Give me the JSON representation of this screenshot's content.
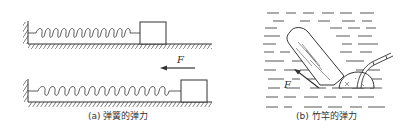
{
  "figure": {
    "panel_a": {
      "caption": "(a) 弹簧的弹力",
      "force_label": "F",
      "elements": [
        "wall",
        "spring-relaxed",
        "block",
        "ground",
        "force-arrow-left",
        "spring-stretched",
        "block-displaced"
      ]
    },
    "panel_b": {
      "caption": "(b) 竹竿的弹力",
      "force_label": "F",
      "elements": [
        "water-lines",
        "log",
        "bamboo-pole",
        "boat-hull",
        "force-arrow-up-left"
      ]
    },
    "colors": {
      "ink": "#333333",
      "background": "#ffffff"
    }
  }
}
